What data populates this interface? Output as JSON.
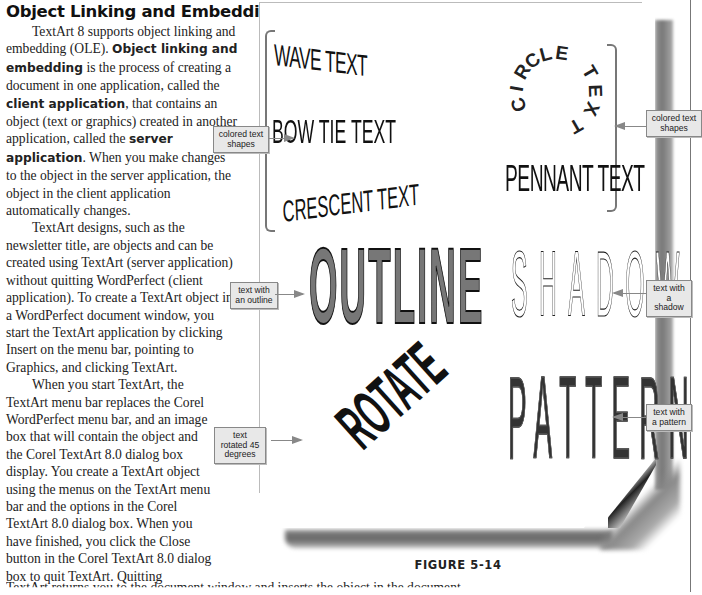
{
  "heading": "Object Linking and Embedding",
  "paragraphs": {
    "p1": [
      "TextArt 8 supports object linking and embedding (OLE). ",
      "Object linking and embedding",
      " is the process of creating a document in one application, called the ",
      "client application",
      ", that contains an object (text or graphics) created in another application, called the ",
      "server application",
      ". When you make changes to the object in the server application, the object in the client application automatically changes."
    ],
    "p2": "TextArt designs, such as the newsletter title, are objects and can be created using TextArt (server application) without quitting WordPerfect (client application). To create a TextArt object in a WordPerfect document window, you start the TextArt application by clicking Insert on the menu bar, pointing to Graphics, and clicking TextArt.",
    "p3": "When you start TextArt, the TextArt menu bar replaces the Corel WordPerfect menu bar, and an image box that will contain the object and the Corel TextArt 8.0 dialog box display. You create a TextArt object using the menus on the TextArt menu bar and the options in the Corel TextArt 8.0 dialog box. When you have finished, you click the Close button in the Corel TextArt 8.0 dialog box to quit TextArt. Quitting",
    "p3_continued": "TextArt returns you to the document window and inserts the object in the document."
  },
  "figure": {
    "caption": "FIGURE 5-14",
    "samples": {
      "wave": "WAVE TEXT",
      "bowtie": "BOW TIE TEXT",
      "crescent": "CRESCENT TEXT",
      "circle": "CIRCLE TEXT",
      "pennant": "PENNANT TEXT",
      "outline": "OUTLINE",
      "shadow": "SHADOW",
      "rotate": "ROTATE",
      "pattern": "PATTERN"
    },
    "callouts": {
      "colored_left": "colored text shapes",
      "colored_right": "colored text shapes",
      "outline": "text with an outline",
      "shadow": "text with a shadow",
      "rotated": "text rotated 45 degrees",
      "pattern": "text with a pattern"
    }
  }
}
